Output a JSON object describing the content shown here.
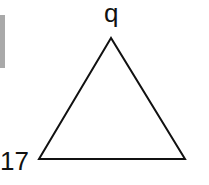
{
  "diagram": {
    "shape": "triangle",
    "labels": {
      "apex": "q",
      "bottom_left": "17"
    },
    "vertices": {
      "apex": [
        111,
        38
      ],
      "bottom_left": [
        39,
        159
      ],
      "bottom_right": [
        185,
        159
      ]
    },
    "stroke_color": "#111111",
    "side_bar_color": "#a9a9a9"
  }
}
